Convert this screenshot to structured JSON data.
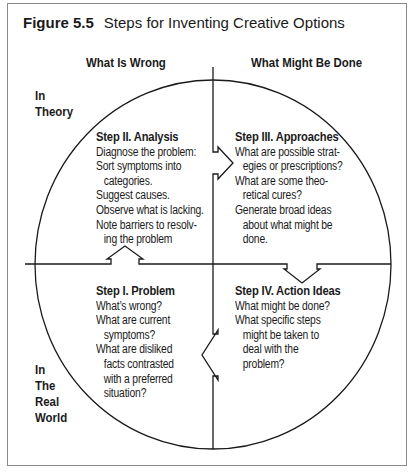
{
  "figure": {
    "number": "Figure 5.5",
    "title": "Steps for Inventing Creative Options"
  },
  "columns": {
    "left": "What Is Wrong",
    "right": "What Might Be Done"
  },
  "rows": {
    "top": [
      "In",
      "Theory"
    ],
    "bottom": [
      "In",
      "The",
      "Real",
      "World"
    ]
  },
  "steps": {
    "step2": {
      "title": "Step II. Analysis",
      "lines": [
        {
          "text": "Diagnose the problem:",
          "indent": false
        },
        {
          "text": "Sort symptoms into",
          "indent": false
        },
        {
          "text": "categories.",
          "indent": true
        },
        {
          "text": "Suggest causes.",
          "indent": false
        },
        {
          "text": "Observe what is lacking.",
          "indent": false
        },
        {
          "text": "Note barriers to resolv-",
          "indent": false
        },
        {
          "text": "ing the problem",
          "indent": true
        }
      ]
    },
    "step3": {
      "title": "Step III. Approaches",
      "lines": [
        {
          "text": "What are possible strat-",
          "indent": false
        },
        {
          "text": "egies or prescriptions?",
          "indent": true
        },
        {
          "text": "What are some theo-",
          "indent": false
        },
        {
          "text": "retical cures?",
          "indent": true
        },
        {
          "text": "Generate broad ideas",
          "indent": false
        },
        {
          "text": "about what might be",
          "indent": true
        },
        {
          "text": "done.",
          "indent": true
        }
      ]
    },
    "step1": {
      "title": "Step I. Problem",
      "lines": [
        {
          "text": "What’s wrong?",
          "indent": false
        },
        {
          "text": "What are current",
          "indent": false
        },
        {
          "text": "symptoms?",
          "indent": true
        },
        {
          "text": "What are disliked",
          "indent": false
        },
        {
          "text": "facts contrasted",
          "indent": true
        },
        {
          "text": "with a preferred",
          "indent": true
        },
        {
          "text": "situation?",
          "indent": true
        }
      ]
    },
    "step4": {
      "title": "Step IV. Action Ideas",
      "lines": [
        {
          "text": "What might be done?",
          "indent": false
        },
        {
          "text": "What specific steps",
          "indent": false
        },
        {
          "text": "might be taken to",
          "indent": true
        },
        {
          "text": "deal with the",
          "indent": true
        },
        {
          "text": "problem?",
          "indent": true
        }
      ]
    }
  },
  "flow": [
    "Step I. Problem",
    "Step II. Analysis",
    "Step III. Approaches",
    "Step IV. Action Ideas"
  ],
  "colors": {
    "line": "#1a1a1a",
    "border": "#8a8a8a",
    "background": "#ffffff"
  }
}
